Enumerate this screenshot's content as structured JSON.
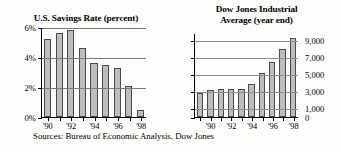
{
  "figure": {
    "source_note": "Sources: Bureau of Economic Analysis, Dow Jones"
  },
  "chart_data": [
    {
      "type": "bar",
      "title": "U.S. Savings Rate (percent)",
      "xlabel": "",
      "ylabel": "",
      "ylim": [
        0,
        6
      ],
      "yticks": [
        0,
        2,
        4,
        6
      ],
      "ytick_labels": [
        "0%",
        "2%",
        "4%",
        "6%"
      ],
      "grid": true,
      "legend": "none",
      "categories": [
        "'90",
        "'91",
        "'92",
        "'93",
        "'94",
        "'95",
        "'96",
        "'97",
        "'98"
      ],
      "tick_labels": [
        "'90",
        "",
        "'92",
        "",
        "'94",
        "",
        "'96",
        "",
        "'98"
      ],
      "values": [
        5.2,
        5.6,
        5.8,
        4.6,
        3.6,
        3.5,
        3.3,
        2.1,
        0.5
      ],
      "bar_color": "#bdbdbd",
      "bar_edge_color": "#4a4a4a"
    },
    {
      "type": "bar",
      "title": "Dow Jones Industrial Average (year end)",
      "title_line1": "Dow Jones Industrial",
      "title_line2": "Average (year end)",
      "xlabel": "",
      "ylabel": "",
      "ylim": [
        0,
        9800
      ],
      "yticks": [
        0,
        1000,
        3000,
        5000,
        7000,
        9000
      ],
      "ytick_labels": [
        "0",
        "1,000",
        "3,000",
        "5,000",
        "7,000",
        "9,000"
      ],
      "grid": true,
      "legend": "none",
      "categories": [
        "'89",
        "'90",
        "'91",
        "'92",
        "'93",
        "'94",
        "'95",
        "'96",
        "'97",
        "'98"
      ],
      "tick_labels": [
        "",
        "'90",
        "",
        "'92",
        "",
        "'94",
        "",
        "'96",
        "",
        "'98"
      ],
      "values": [
        2750,
        3170,
        3300,
        3300,
        3300,
        3830,
        5120,
        6450,
        7900,
        9180
      ],
      "bar_color": "#bdbdbd",
      "bar_edge_color": "#4a4a4a"
    }
  ]
}
